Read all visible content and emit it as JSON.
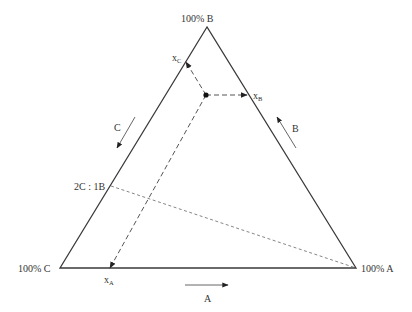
{
  "diagram": {
    "type": "ternary-phase-diagram",
    "vertices": {
      "B": {
        "label": "100% B",
        "x": 207,
        "y": 27
      },
      "C": {
        "label": "100% C",
        "x": 60,
        "y": 268
      },
      "A": {
        "label": "100% A",
        "x": 356,
        "y": 268
      }
    },
    "composition_point": {
      "x": 206,
      "y": 95
    },
    "projections": [
      {
        "id": "xA",
        "label": "x",
        "sub": "A",
        "to": {
          "x": 110,
          "y": 268
        },
        "label_pos": {
          "x": 104,
          "y": 283
        }
      },
      {
        "id": "xB",
        "label": "x",
        "sub": "B",
        "to": {
          "x": 247,
          "y": 95
        },
        "label_pos": {
          "x": 253,
          "y": 99
        }
      },
      {
        "id": "xC",
        "label": "x",
        "sub": "C",
        "to": {
          "x": 186,
          "y": 62
        },
        "label_pos": {
          "x": 172,
          "y": 61
        }
      }
    ],
    "ratio_line": {
      "label": "2C : 1B",
      "from": {
        "x": 111,
        "y": 186
      },
      "to": {
        "x": 356,
        "y": 268
      },
      "label_pos": {
        "x": 74,
        "y": 190
      }
    },
    "direction_arrows": [
      {
        "label": "A",
        "from": {
          "x": 185,
          "y": 285
        },
        "to": {
          "x": 228,
          "y": 285
        },
        "label_pos": {
          "x": 204,
          "y": 302
        }
      },
      {
        "label": "B",
        "from": {
          "x": 296,
          "y": 148
        },
        "to": {
          "x": 277,
          "y": 117
        },
        "label_pos": {
          "x": 292,
          "y": 132
        }
      },
      {
        "label": "C",
        "from": {
          "x": 135,
          "y": 117
        },
        "to": {
          "x": 117,
          "y": 148
        },
        "label_pos": {
          "x": 114,
          "y": 131
        }
      }
    ]
  }
}
